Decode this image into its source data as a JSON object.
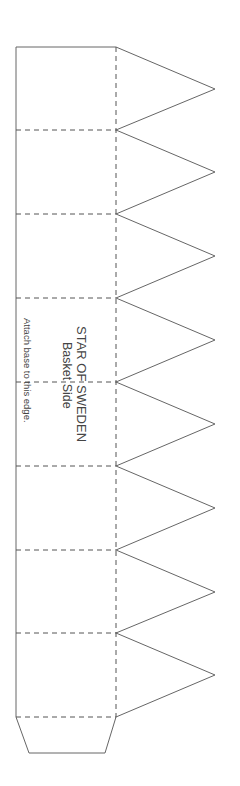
{
  "template": {
    "title": "STAR OF SWEDEN",
    "subtitle": "Basket Side",
    "instruction": "Attach base  to this edge."
  },
  "colors": {
    "line": "#666666",
    "text": "#444444"
  }
}
